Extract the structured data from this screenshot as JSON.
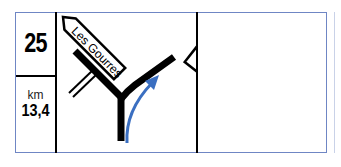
{
  "cell": {
    "number": "25",
    "unit": "km",
    "distance": "13,4"
  },
  "diagram": {
    "signs": [
      {
        "label": "Les Gourres",
        "direction": "up-left"
      },
      {
        "label": "Le Pomeyret",
        "direction": "up-right"
      }
    ],
    "route_arrow_color": "#3b6fc1"
  },
  "colors": {
    "frame": "#6f86c4",
    "ink": "#000000"
  }
}
